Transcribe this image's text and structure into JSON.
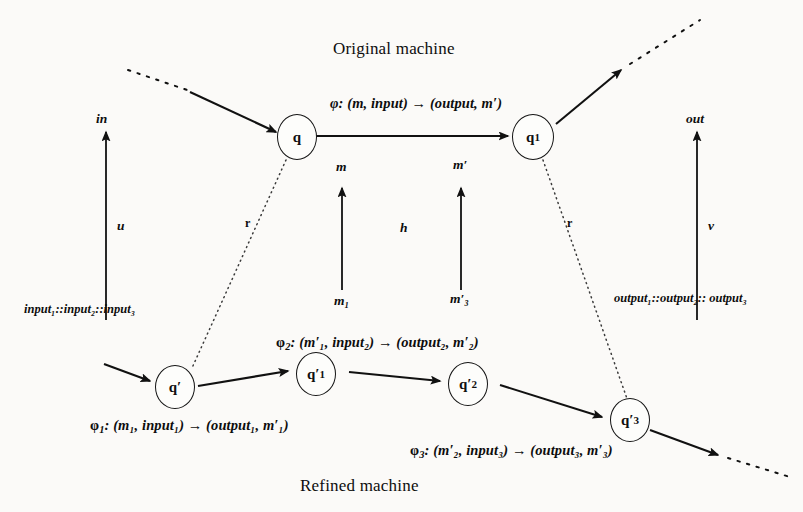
{
  "diagram": {
    "title_top": "Original machine",
    "title_bottom": "Refined machine",
    "background_color": "#fbfaf8",
    "ink_color": "#111111"
  },
  "original_machine": {
    "states": [
      {
        "id": "q",
        "label": "q",
        "sub": ""
      },
      {
        "id": "q1",
        "label": "q",
        "sub": "1"
      }
    ],
    "transition_formula": "φ: (m, input) → (output, m′)",
    "phi_symbol": "φ",
    "transition_rest": ": (m, input) → (output, m′)",
    "memory_in_label": "m",
    "memory_out_label": "m′"
  },
  "refined_machine": {
    "states": [
      {
        "id": "qp",
        "label": "q′",
        "sub": ""
      },
      {
        "id": "qp1",
        "label": "q′",
        "sub": "1"
      },
      {
        "id": "qp2",
        "label": "q′",
        "sub": "2"
      },
      {
        "id": "qp3",
        "label": "q′",
        "sub": "3"
      }
    ],
    "formulas": [
      {
        "name": "phi1",
        "phi": "φ",
        "sub": "1",
        "rest": ": (m₁, input₁) → (output₁, m′₁)"
      },
      {
        "name": "phi2",
        "phi": "φ",
        "sub": "2",
        "rest": ": (m′₁, input₂) → (output₂, m′₂)"
      },
      {
        "name": "phi3",
        "phi": "φ",
        "sub": "3",
        "rest": ": (m′₂, input₃) → (output₃, m′₃)"
      }
    ],
    "memory_in_label": "m₁",
    "memory_out_label": "m′₃"
  },
  "abstraction_maps": {
    "input_map_label": "u",
    "output_map_label": "v",
    "memory_map_label": "h",
    "state_map_left_label": "r",
    "state_map_right_label": "r"
  },
  "io_labels": {
    "in_top": "in",
    "out_top": "out",
    "input_sequence": "input₁::input₂::input₃",
    "output_sequence": "output₁::output₂:: output₃"
  }
}
